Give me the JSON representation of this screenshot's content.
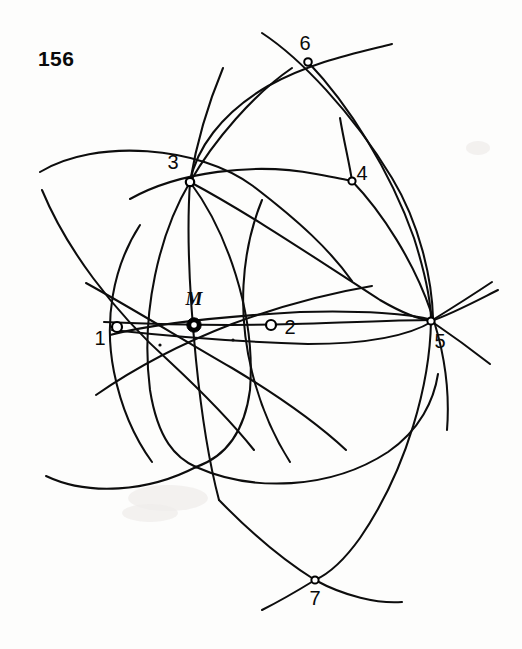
{
  "figure": {
    "number_label": "156",
    "caption_position": "top-left",
    "background_color": "#fdfdfc",
    "ink_color": "#0d0d0d",
    "width": 522,
    "height": 649
  },
  "points": [
    {
      "id": "p1",
      "label": "1",
      "x": 117,
      "y": 327,
      "marker": "open-circle",
      "radius": 5.0,
      "label_x": 100,
      "label_y": 345
    },
    {
      "id": "p2",
      "label": "2",
      "x": 271,
      "y": 325,
      "marker": "open-circle",
      "radius": 5.0,
      "label_x": 290,
      "label_y": 334
    },
    {
      "id": "p3",
      "label": "3",
      "x": 190,
      "y": 182,
      "marker": "open-circle",
      "radius": 4.2,
      "label_x": 173,
      "label_y": 169
    },
    {
      "id": "p4",
      "label": "4",
      "x": 352,
      "y": 181,
      "marker": "small-circle",
      "radius": 3.6,
      "label_x": 362,
      "label_y": 180
    },
    {
      "id": "p5",
      "label": "5",
      "x": 431,
      "y": 321,
      "marker": "small-circle",
      "radius": 3.6,
      "label_x": 440,
      "label_y": 348
    },
    {
      "id": "p6",
      "label": "6",
      "x": 308,
      "y": 62,
      "marker": "small-circle",
      "radius": 3.8,
      "label_x": 305,
      "label_y": 50
    },
    {
      "id": "p7",
      "label": "7",
      "x": 315,
      "y": 580,
      "marker": "small-circle",
      "radius": 3.6,
      "label_x": 315,
      "label_y": 605
    },
    {
      "id": "pM",
      "label": "M",
      "x": 194,
      "y": 325,
      "marker": "center-ring",
      "radius": 7.2,
      "label_x": 194,
      "label_y": 305
    }
  ],
  "unlabeled_nodes": [
    {
      "id": "n-lower",
      "x": 196,
      "y": 467
    },
    {
      "id": "n-left",
      "x": 160,
      "y": 345
    },
    {
      "id": "n-mid",
      "x": 233,
      "y": 340
    }
  ],
  "arcs": [
    {
      "id": "arc-upper-left-flat",
      "d": "M 40,172 C 95,138 200,146 253,186 C 300,222 330,250 352,281"
    },
    {
      "id": "arc-top-ridge",
      "d": "M 262,33 C 300,58 352,112 392,178 C 420,224 432,280 433,318"
    },
    {
      "id": "arc-top-right-sweep",
      "d": "M 392,44 C 352,54 312,62 268,86 C 220,114 196,150 190,182"
    },
    {
      "id": "arc-crown-3-to-5",
      "d": "M 190,182 C 250,214 318,260 380,300 C 404,314 422,320 433,321"
    },
    {
      "id": "arc-p3-to-p6-rise",
      "d": "M 190,182 C 214,140 254,94 292,68"
    },
    {
      "id": "arc-6-down-right",
      "d": "M 308,62 C 348,104 390,170 414,238 C 426,276 431,305 431,321"
    },
    {
      "id": "arc-3-arch-to-4",
      "d": "M 130,199 C 178,172 254,162 316,174 C 338,178 348,180 352,181"
    },
    {
      "id": "arc-4-through-5-tail",
      "d": "M 352,181 C 382,212 414,262 431,312 C 444,350 450,392 447,430"
    },
    {
      "id": "arc-3-vertical-up",
      "d": "M 223,68 C 208,104 196,146 190,182"
    },
    {
      "id": "arc-3-vertical-down",
      "d": "M 190,182 C 186,240 190,300 196,360 C 202,420 210,466 219,500"
    },
    {
      "id": "arc-left-big-circle",
      "d": "M 42,190 C 66,248 112,310 170,362 C 200,390 230,420 254,450"
    },
    {
      "id": "arc-left-lower-bowl",
      "d": "M 46,476 C 88,496 148,492 196,467"
    },
    {
      "id": "arc-3-to-lower-left",
      "d": "M 190,182 C 160,232 140,312 150,390 C 158,440 176,458 196,467"
    },
    {
      "id": "arc-3-to-lower-right",
      "d": "M 190,182 C 226,230 256,312 250,390 C 244,436 222,458 196,467"
    },
    {
      "id": "arc-M-horizontal",
      "d": "M 104,322 C 150,324 228,326 294,324 C 356,322 404,320 433,320"
    },
    {
      "id": "arc-thru-M-lens-top",
      "d": "M 110,335 C 160,322 230,316 300,312 C 364,310 410,314 433,320"
    },
    {
      "id": "arc-thru-M-lens-bot",
      "d": "M 112,330 C 168,336 238,342 308,344 C 372,344 412,334 433,321"
    },
    {
      "id": "arc-diag-left-up",
      "d": "M 86,283 C 128,306 180,338 232,368 C 282,398 318,424 346,450"
    },
    {
      "id": "arc-diag-left-down",
      "d": "M 96,395 C 132,370 180,344 232,324 C 286,304 336,292 372,286"
    },
    {
      "id": "arc-1-circle-left",
      "d": "M 140,225 C 112,268 104,322 114,372 C 122,412 136,440 152,462"
    },
    {
      "id": "arc-2-circle-left",
      "d": "M 262,200 C 240,254 238,316 252,372 C 262,412 276,440 290,462"
    },
    {
      "id": "arc-right-low-bowl",
      "d": "M 196,467 C 252,492 330,490 388,452 C 420,430 434,400 438,374"
    },
    {
      "id": "arc-7-left-leg",
      "d": "M 219,500 C 250,532 286,562 315,580"
    },
    {
      "id": "arc-7-right-leg",
      "d": "M 431,321 C 430,382 408,468 360,538 C 340,566 324,576 315,580"
    },
    {
      "id": "arc-7-tail-left",
      "d": "M 262,610 C 282,600 302,588 315,580"
    },
    {
      "id": "arc-7-tail-right",
      "d": "M 315,580 C 344,596 378,604 402,602"
    },
    {
      "id": "arc-5-spur-upper",
      "d": "M 431,321 C 452,308 474,294 492,282"
    },
    {
      "id": "arc-5-spur-lower",
      "d": "M 431,321 C 452,314 478,300 498,290"
    },
    {
      "id": "arc-5-spur-down",
      "d": "M 431,321 C 450,334 472,350 490,364"
    },
    {
      "id": "arc-4-stub-up",
      "d": "M 340,118 C 344,142 350,166 352,181"
    }
  ],
  "colors": {
    "ink": "#0d0d0d",
    "paper": "#fdfdfc",
    "marker_fill": "#ffffff",
    "label_text": "#0a0a0a"
  }
}
